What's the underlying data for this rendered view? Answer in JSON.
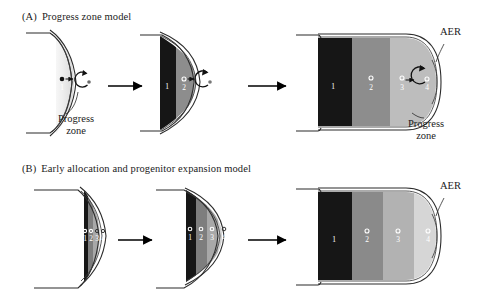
{
  "figure": {
    "background_color": "#ffffff",
    "ink_color": "#1b1b1b"
  },
  "panels": [
    {
      "id": "A",
      "tag": "(A)",
      "title": "Progress zone model",
      "stages": [
        {
          "name": "stage-1",
          "zones": [],
          "progress_zone_shade": "#d9d9d9",
          "markers": [
            {
              "label": "1",
              "type": "filled-dot"
            }
          ],
          "has_rotation_arrow": true
        },
        {
          "name": "stage-2",
          "zones": [
            {
              "label": "1",
              "color": "#161616"
            },
            {
              "label": "2",
              "color": "#8d8d8d"
            }
          ],
          "progress_zone_shade": "#bdbdbd",
          "markers": [
            {
              "label": "2",
              "type": "open-ring"
            }
          ],
          "has_rotation_arrow": true
        },
        {
          "name": "stage-3",
          "zones": [
            {
              "label": "1",
              "color": "#161616"
            },
            {
              "label": "2",
              "color": "#8d8d8d"
            },
            {
              "label": "3",
              "color": "#bdbdbd"
            }
          ],
          "progress_zone_shade": "#bdbdbd",
          "markers": [
            {
              "label": "3",
              "type": "open-ring"
            },
            {
              "label": "4",
              "type": "open-ring"
            }
          ],
          "has_rotation_arrow": true
        }
      ],
      "annotations": [
        {
          "name": "progress-zone-label-stage1",
          "text_line1": "Progress",
          "text_line2": "zone"
        },
        {
          "name": "aer-label-stage3",
          "text_line1": "AER",
          "text_line2": ""
        },
        {
          "name": "progress-zone-label-stage3",
          "text_line1": "Progress",
          "text_line2": "zone"
        }
      ],
      "arrows": [
        "arrow-1-to-2",
        "arrow-2-to-3"
      ]
    },
    {
      "id": "B",
      "tag": "(B)",
      "title": "Early allocation and progenitor expansion model",
      "stages": [
        {
          "name": "stage-1",
          "zones": [
            {
              "label": "1",
              "color": "#161616"
            },
            {
              "label": "2",
              "color": "#7e7e7e"
            },
            {
              "label": "3",
              "color": "#a8a8a8"
            },
            {
              "label": "4",
              "color": "#cfcfcf"
            }
          ],
          "markers": [
            {
              "label": "1",
              "type": "open-ring"
            },
            {
              "label": "2",
              "type": "open-ring"
            },
            {
              "label": "3",
              "type": "open-ring"
            },
            {
              "label": "4",
              "type": "open-ring"
            }
          ]
        },
        {
          "name": "stage-2",
          "zones": [
            {
              "label": "1",
              "color": "#161616"
            },
            {
              "label": "2",
              "color": "#7e7e7e"
            },
            {
              "label": "3",
              "color": "#a8a8a8"
            },
            {
              "label": "4",
              "color": "#cfcfcf"
            }
          ],
          "markers": [
            {
              "label": "1",
              "type": "open-ring"
            },
            {
              "label": "2",
              "type": "open-ring"
            },
            {
              "label": "3",
              "type": "open-ring"
            },
            {
              "label": "4",
              "type": "open-ring"
            }
          ]
        },
        {
          "name": "stage-3",
          "zones": [
            {
              "label": "1",
              "color": "#161616"
            },
            {
              "label": "2",
              "color": "#8a8a8a"
            },
            {
              "label": "3",
              "color": "#b2b2b2"
            },
            {
              "label": "4",
              "color": "#d6d6d6"
            }
          ],
          "markers": [
            {
              "label": "1",
              "type": "open-ring"
            },
            {
              "label": "2",
              "type": "open-ring"
            },
            {
              "label": "3",
              "type": "open-ring"
            },
            {
              "label": "4",
              "type": "open-ring"
            }
          ]
        }
      ],
      "annotations": [
        {
          "name": "aer-label-stage3",
          "text_line1": "AER",
          "text_line2": ""
        }
      ],
      "arrows": [
        "arrow-1-to-2",
        "arrow-2-to-3"
      ]
    }
  ],
  "labels": {
    "aer": "AER",
    "progress": "Progress",
    "zone": "zone"
  }
}
